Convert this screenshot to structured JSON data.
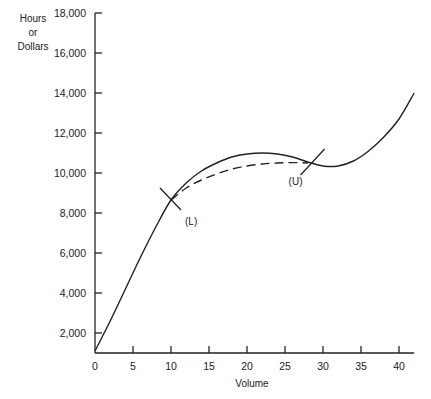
{
  "chart_data": {
    "type": "line",
    "title": "",
    "xlabel": "Volume",
    "ylabel": [
      "Hours",
      "or",
      "Dollars"
    ],
    "xlim": [
      0,
      42
    ],
    "ylim": [
      1000,
      18000
    ],
    "grid": false,
    "x_ticks": [
      0,
      5,
      10,
      15,
      20,
      25,
      30,
      35,
      40
    ],
    "x_tick_labels": [
      "0",
      "5",
      "10",
      "15",
      "20",
      "25",
      "30",
      "35",
      "40"
    ],
    "y_ticks": [
      2000,
      4000,
      6000,
      8000,
      10000,
      12000,
      14000,
      16000,
      18000
    ],
    "y_tick_labels": [
      "2,000",
      "4,000",
      "6,000",
      "8,000",
      "10,000",
      "12,000",
      "14,000",
      "16,000",
      "18,000"
    ],
    "series": [
      {
        "name": "Actual cost curve",
        "style": "solid",
        "x": [
          0,
          2,
          4,
          6,
          8,
          10,
          12,
          14,
          16,
          18,
          20,
          22,
          24,
          26,
          28,
          30,
          32,
          34,
          36,
          38,
          40,
          42
        ],
        "y": [
          1100,
          2600,
          4200,
          5800,
          7300,
          8650,
          9500,
          10100,
          10500,
          10800,
          10950,
          11000,
          10950,
          10800,
          10550,
          10350,
          10350,
          10600,
          11100,
          11800,
          12700,
          14000
        ]
      },
      {
        "name": "Smoothed curve (L to U)",
        "style": "dashed",
        "x": [
          10,
          12,
          14,
          16,
          18,
          20,
          22,
          24,
          26,
          28
        ],
        "y": [
          8650,
          9250,
          9650,
          9950,
          10200,
          10350,
          10450,
          10500,
          10520,
          10500
        ]
      }
    ],
    "annotations": [
      {
        "label": "(L)",
        "x": 10,
        "y": 8650
      },
      {
        "label": "(U)",
        "x": 28.5,
        "y": 10500
      }
    ]
  }
}
